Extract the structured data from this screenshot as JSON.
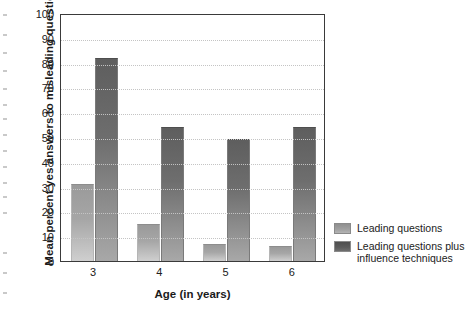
{
  "chart_data": {
    "type": "bar",
    "title": "",
    "xlabel": "Age (in years)",
    "ylabel": "Mean percent yes answers to misleading questions",
    "categories": [
      "3",
      "4",
      "5",
      "6"
    ],
    "ylim": [
      0,
      100
    ],
    "yticks": [
      "0",
      "10",
      "20",
      "30",
      "40",
      "50",
      "60",
      "70",
      "80",
      "90",
      "100"
    ],
    "grid": true,
    "legend_position": "right",
    "series": [
      {
        "name": "Leading questions",
        "color": "#9a9a9a",
        "values": [
          31,
          15,
          7,
          6
        ]
      },
      {
        "name": "Leading questions plus influence techniques",
        "color": "#5e5e5e",
        "values": [
          82,
          54,
          49,
          54
        ]
      }
    ]
  },
  "legend": {
    "entries": [
      {
        "label": "Leading questions"
      },
      {
        "label": "Leading questions plus influence techniques"
      }
    ]
  }
}
